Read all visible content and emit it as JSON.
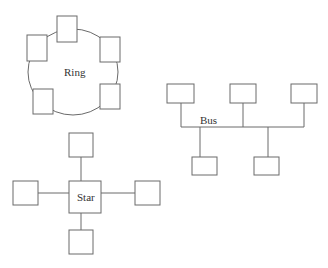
{
  "diagram": {
    "type": "network-topologies",
    "topologies": [
      {
        "name": "ring",
        "label": "Ring",
        "nodes": 6,
        "ring": {
          "cx": 73,
          "cy": 72,
          "rx": 45,
          "ry": 43
        },
        "node_boxes": [
          {
            "x": 57,
            "y": 16,
            "w": 20,
            "h": 26
          },
          {
            "x": 27,
            "y": 35,
            "w": 20,
            "h": 26
          },
          {
            "x": 100,
            "y": 37,
            "w": 20,
            "h": 25
          },
          {
            "x": 33,
            "y": 89,
            "w": 20,
            "h": 25
          },
          {
            "x": 100,
            "y": 84,
            "w": 20,
            "h": 25
          }
        ],
        "label_pos": {
          "x": 64,
          "y": 76
        }
      },
      {
        "name": "bus",
        "label": "Bus",
        "nodes": 5,
        "bus_line": {
          "x1": 181,
          "x2": 304,
          "y": 127
        },
        "node_boxes": [
          {
            "x": 167,
            "y": 84,
            "w": 27,
            "h": 19,
            "drop_x": 181,
            "side": "top"
          },
          {
            "x": 230,
            "y": 84,
            "w": 26,
            "h": 19,
            "drop_x": 243,
            "side": "top"
          },
          {
            "x": 291,
            "y": 84,
            "w": 26,
            "h": 19,
            "drop_x": 304,
            "side": "top"
          },
          {
            "x": 192,
            "y": 157,
            "w": 25,
            "h": 18,
            "drop_x": 200,
            "side": "bottom"
          },
          {
            "x": 254,
            "y": 157,
            "w": 25,
            "h": 18,
            "drop_x": 268,
            "side": "bottom"
          }
        ],
        "label_pos": {
          "x": 200,
          "y": 124
        }
      },
      {
        "name": "star",
        "label": "Star",
        "nodes": 5,
        "hub": {
          "x": 69,
          "y": 181,
          "w": 32,
          "h": 32
        },
        "node_boxes": [
          {
            "x": 69,
            "y": 133,
            "w": 24,
            "h": 24,
            "side": "top"
          },
          {
            "x": 13,
            "y": 181,
            "w": 25,
            "h": 24,
            "side": "left"
          },
          {
            "x": 135,
            "y": 181,
            "w": 25,
            "h": 24,
            "side": "right"
          },
          {
            "x": 69,
            "y": 230,
            "w": 24,
            "h": 24,
            "side": "bottom"
          }
        ],
        "label_pos": {
          "x": 77,
          "y": 201
        }
      }
    ]
  }
}
